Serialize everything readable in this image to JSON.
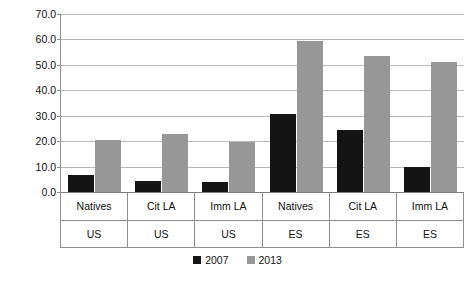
{
  "chart_data": {
    "type": "bar",
    "title": "",
    "xlabel": "",
    "ylabel": "Percentage",
    "ylim": [
      0,
      70
    ],
    "ytick_step": 10,
    "ytick_labels": [
      "70.0",
      "60.0",
      "50.0",
      "40.0",
      "30.0",
      "20.0",
      "10.0",
      "0.0"
    ],
    "ytick_values": [
      70,
      60,
      50,
      40,
      30,
      20,
      10,
      0
    ],
    "grid": true,
    "legend_position": "bottom",
    "categories": [
      "Natives",
      "Cit LA",
      "Imm LA",
      "Natives",
      "Cit LA",
      "Imm LA"
    ],
    "group_labels": [
      "US",
      "US",
      "US",
      "ES",
      "ES",
      "ES"
    ],
    "series": [
      {
        "name": "2007",
        "color": "#141414",
        "values": [
          6.7,
          4.5,
          4.0,
          30.7,
          24.5,
          9.9
        ]
      },
      {
        "name": "2013",
        "color": "#979797",
        "values": [
          20.3,
          23.0,
          19.5,
          59.3,
          53.6,
          51.0
        ]
      }
    ]
  },
  "legend": {
    "entries": [
      {
        "label": "2007"
      },
      {
        "label": "2013"
      }
    ]
  }
}
